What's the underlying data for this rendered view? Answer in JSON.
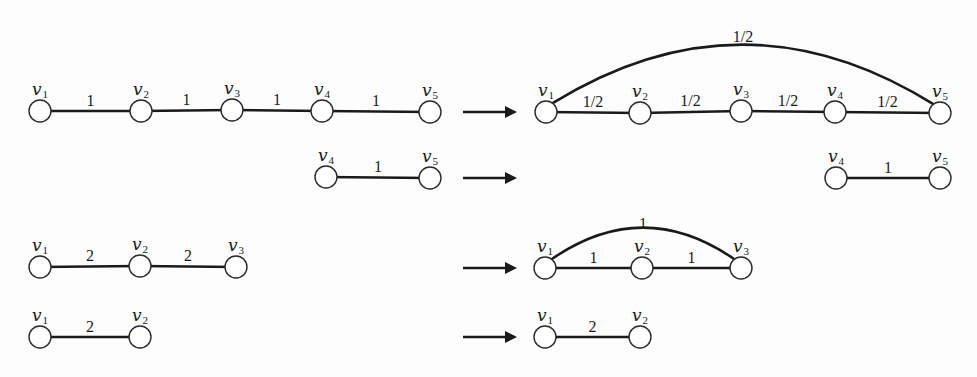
{
  "node_radius": 11,
  "colors": {
    "stroke": "#1a1a1a",
    "node_fill": "#ffffff",
    "background": "#fdfdfd"
  },
  "rows": [
    {
      "left": {
        "nodes": [
          {
            "id": "v1",
            "label": "v",
            "sub": "1",
            "x": 40,
            "y": 111
          },
          {
            "id": "v2",
            "label": "v",
            "sub": "2",
            "x": 141,
            "y": 111
          },
          {
            "id": "v3",
            "label": "v",
            "sub": "3",
            "x": 232,
            "y": 110
          },
          {
            "id": "v4",
            "label": "v",
            "sub": "4",
            "x": 322,
            "y": 111
          },
          {
            "id": "v5",
            "label": "v",
            "sub": "5",
            "x": 430,
            "y": 112
          }
        ],
        "edges": [
          {
            "from": 0,
            "to": 1,
            "weight": "1"
          },
          {
            "from": 1,
            "to": 2,
            "weight": "1"
          },
          {
            "from": 2,
            "to": 3,
            "weight": "1"
          },
          {
            "from": 3,
            "to": 4,
            "weight": "1"
          }
        ]
      },
      "arrow": {
        "x1": 463,
        "x2": 517,
        "y": 112
      },
      "right": {
        "nodes": [
          {
            "id": "v1",
            "label": "v",
            "sub": "1",
            "x": 546,
            "y": 112
          },
          {
            "id": "v2",
            "label": "v",
            "sub": "2",
            "x": 640,
            "y": 113
          },
          {
            "id": "v3",
            "label": "v",
            "sub": "3",
            "x": 741,
            "y": 111
          },
          {
            "id": "v4",
            "label": "v",
            "sub": "4",
            "x": 835,
            "y": 112
          },
          {
            "id": "v5",
            "label": "v",
            "sub": "5",
            "x": 940,
            "y": 113
          }
        ],
        "edges": [
          {
            "from": 0,
            "to": 1,
            "weight": "1/2"
          },
          {
            "from": 1,
            "to": 2,
            "weight": "1/2"
          },
          {
            "from": 2,
            "to": 3,
            "weight": "1/2"
          },
          {
            "from": 3,
            "to": 4,
            "weight": "1/2"
          },
          {
            "from": 0,
            "to": 4,
            "weight": "1/2",
            "arc_peak_y": 49,
            "weight_y": 42
          }
        ]
      }
    },
    {
      "left": {
        "nodes": [
          {
            "id": "v4",
            "label": "v",
            "sub": "4",
            "x": 326,
            "y": 177
          },
          {
            "id": "v5",
            "label": "v",
            "sub": "5",
            "x": 430,
            "y": 178
          }
        ],
        "edges": [
          {
            "from": 0,
            "to": 1,
            "weight": "1"
          }
        ]
      },
      "arrow": {
        "x1": 463,
        "x2": 517,
        "y": 178
      },
      "right": {
        "nodes": [
          {
            "id": "v4",
            "label": "v",
            "sub": "4",
            "x": 836,
            "y": 178
          },
          {
            "id": "v5",
            "label": "v",
            "sub": "5",
            "x": 940,
            "y": 178
          }
        ],
        "edges": [
          {
            "from": 0,
            "to": 1,
            "weight": "1"
          }
        ]
      }
    },
    {
      "left": {
        "nodes": [
          {
            "id": "v1",
            "label": "v",
            "sub": "1",
            "x": 40,
            "y": 267
          },
          {
            "id": "v2",
            "label": "v",
            "sub": "2",
            "x": 140,
            "y": 266
          },
          {
            "id": "v3",
            "label": "v",
            "sub": "3",
            "x": 236,
            "y": 267
          }
        ],
        "edges": [
          {
            "from": 0,
            "to": 1,
            "weight": "2"
          },
          {
            "from": 1,
            "to": 2,
            "weight": "2"
          }
        ]
      },
      "arrow": {
        "x1": 463,
        "x2": 517,
        "y": 268
      },
      "right": {
        "nodes": [
          {
            "id": "v1",
            "label": "v",
            "sub": "1",
            "x": 545,
            "y": 268
          },
          {
            "id": "v2",
            "label": "v",
            "sub": "2",
            "x": 642,
            "y": 268
          },
          {
            "id": "v3",
            "label": "v",
            "sub": "3",
            "x": 741,
            "y": 268
          }
        ],
        "edges": [
          {
            "from": 0,
            "to": 1,
            "weight": "1"
          },
          {
            "from": 1,
            "to": 2,
            "weight": "1"
          },
          {
            "from": 0,
            "to": 2,
            "weight": "1",
            "arc_peak_y": 232,
            "weight_y": 229
          }
        ]
      }
    },
    {
      "left": {
        "nodes": [
          {
            "id": "v1",
            "label": "v",
            "sub": "1",
            "x": 40,
            "y": 337
          },
          {
            "id": "v2",
            "label": "v",
            "sub": "2",
            "x": 140,
            "y": 337
          }
        ],
        "edges": [
          {
            "from": 0,
            "to": 1,
            "weight": "2"
          }
        ]
      },
      "arrow": {
        "x1": 463,
        "x2": 517,
        "y": 337
      },
      "right": {
        "nodes": [
          {
            "id": "v1",
            "label": "v",
            "sub": "1",
            "x": 545,
            "y": 337
          },
          {
            "id": "v2",
            "label": "v",
            "sub": "2",
            "x": 640,
            "y": 337
          }
        ],
        "edges": [
          {
            "from": 0,
            "to": 1,
            "weight": "2"
          }
        ]
      }
    }
  ]
}
